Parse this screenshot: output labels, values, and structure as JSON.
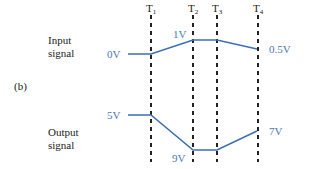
{
  "panel_label": "(b)",
  "time_markers": [
    {
      "label": "T",
      "sub": "1",
      "x": 151
    },
    {
      "label": "T",
      "sub": "2",
      "x": 193
    },
    {
      "label": "T",
      "sub": "3",
      "x": 217
    },
    {
      "label": "T",
      "sub": "4",
      "x": 258
    }
  ],
  "input": {
    "title_line1": "Input",
    "title_line2": "signal",
    "start_label": "0V",
    "peak_label": "1V",
    "end_label": "0.5V",
    "color": "#3b6fb6"
  },
  "output": {
    "title_line1": "Output",
    "title_line2": "signal",
    "start_label": "5V",
    "trough_label": "9V",
    "end_label": "7V",
    "color": "#3b6fb6"
  },
  "colors": {
    "signal_line": "#3b6fb6",
    "label_blue": "#4a78b8",
    "dashed": "#222222",
    "text": "#222222"
  }
}
